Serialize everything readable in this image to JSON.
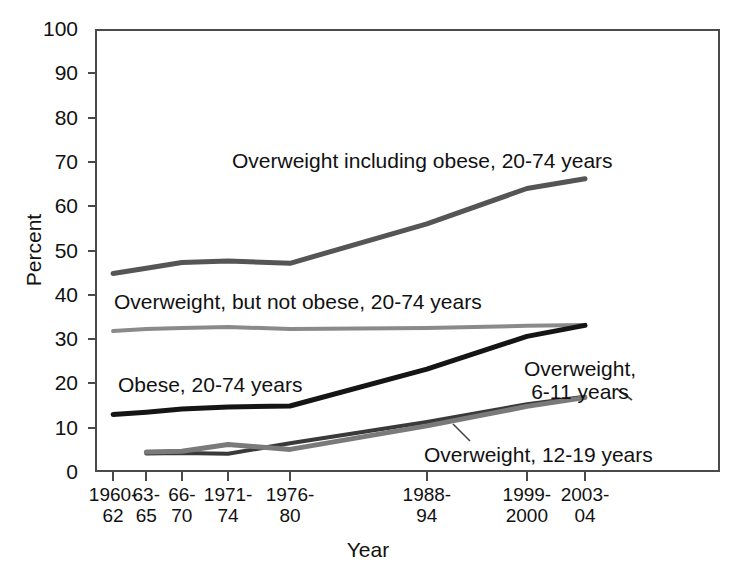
{
  "chart_data": {
    "type": "line",
    "title": "",
    "xlabel": "Year",
    "ylabel": "Percent",
    "ylim": [
      0,
      100
    ],
    "ytick_values": [
      0,
      10,
      20,
      30,
      40,
      50,
      60,
      70,
      80,
      90,
      100
    ],
    "ytick_labels": [
      "0",
      "10",
      "20",
      "30",
      "40",
      "50",
      "60",
      "70",
      "80",
      "90",
      "100"
    ],
    "grid": false,
    "legend_position": "inline-annotations",
    "categories": [
      "1960-\n62",
      "63-\n65",
      "66-\n70",
      "1971-\n74",
      "1976-\n80",
      "1988-\n94",
      "1999-\n2000",
      "2003-\n04"
    ],
    "category_x_fraction": [
      0.029,
      0.082,
      0.139,
      0.213,
      0.312,
      0.531,
      0.691,
      0.784
    ],
    "series": [
      {
        "name": "Overweight including obese, 20-74 years",
        "color": "#555555",
        "width": 5,
        "values": [
          44.8,
          46.0,
          47.3,
          47.6,
          47.1,
          56.0,
          64.0,
          66.2
        ]
      },
      {
        "name": "Overweight, but not obese, 20-74 years",
        "color": "#8a8a8a",
        "width": 4,
        "values": [
          31.8,
          32.3,
          32.5,
          32.7,
          32.3,
          32.5,
          33.0,
          33.2
        ]
      },
      {
        "name": "Obese, 20-74 years",
        "color": "#151515",
        "width": 5,
        "values": [
          13.0,
          13.5,
          14.2,
          14.7,
          14.9,
          23.2,
          30.6,
          33.1
        ]
      },
      {
        "name": "Overweight, 6-11 years",
        "color": "#3a3a3a",
        "width": 4,
        "values": [
          null,
          4.2,
          4.3,
          4.1,
          6.5,
          11.3,
          15.3,
          17.0
        ]
      },
      {
        "name": "Overweight, 12-19 years",
        "color": "#7a7a7a",
        "width": 5,
        "values": [
          null,
          4.5,
          4.7,
          6.2,
          5.1,
          10.4,
          14.8,
          16.8
        ]
      }
    ],
    "annotations": [
      {
        "text": "Overweight including obese, 20-74 years",
        "series": "Overweight including obese, 20-74 years"
      },
      {
        "text": "Overweight, but not obese, 20-74 years",
        "series": "Overweight, but not obese, 20-74 years"
      },
      {
        "text": "Obese, 20-74 years",
        "series": "Obese, 20-74 years"
      },
      {
        "text": "Overweight,\n6-11 years",
        "series": "Overweight, 6-11 years"
      },
      {
        "text": "Overweight, 12-19 years",
        "series": "Overweight, 12-19 years"
      }
    ]
  },
  "axes": {
    "y_title": "Percent",
    "x_title": "Year"
  },
  "labels": {
    "ow_including_obese": "Overweight including obese, 20-74 years",
    "ow_not_obese": "Overweight, but not obese, 20-74 years",
    "obese": "Obese, 20-74 years",
    "ow_6_11": "Overweight,\n6-11 years",
    "ow_12_19": "Overweight, 12-19 years"
  },
  "colors": {
    "frame": "#4a4a4a",
    "text": "#111111"
  }
}
